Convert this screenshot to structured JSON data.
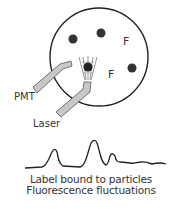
{
  "diagram": {
    "sample_circle": {
      "cx": 99,
      "cy": 57,
      "r": 49,
      "stroke": "#222222"
    },
    "particles": [
      {
        "cx": 73,
        "cy": 39,
        "r": 4.5
      },
      {
        "cx": 101,
        "cy": 33,
        "r": 4.5
      },
      {
        "cx": 132,
        "cy": 68,
        "r": 4.5
      },
      {
        "cx": 88,
        "cy": 67,
        "r": 4.5
      }
    ],
    "free_label_markers": [
      {
        "text": "F",
        "x": 123,
        "y": 45
      },
      {
        "text": "F",
        "x": 108,
        "y": 78
      }
    ],
    "labels": {
      "pmt": "PMT",
      "laser": "Laser"
    },
    "colors": {
      "probe_fill": "#c8c8c8",
      "probe_stroke": "#555555",
      "particle": "#333333",
      "line": "#222222"
    },
    "caption": {
      "line1": "Label bound to particles",
      "line2": "Fluorescence fluctuations"
    }
  }
}
